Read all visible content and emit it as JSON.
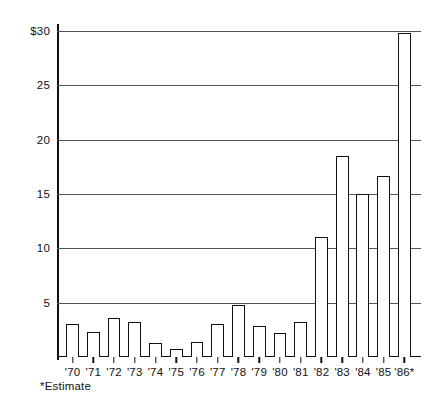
{
  "chart_data": {
    "type": "bar",
    "title": "",
    "subtitle": "",
    "xlabel": "",
    "ylabel": "",
    "categories": [
      "'70",
      "'71",
      "'72",
      "'73",
      "'74",
      "'75",
      "'76",
      "'77",
      "'78",
      "'79",
      "'80",
      "'81",
      "'82",
      "'83",
      "'84",
      "'85",
      "'86*"
    ],
    "values": [
      3.0,
      2.3,
      3.6,
      3.2,
      1.3,
      0.7,
      1.4,
      3.0,
      4.8,
      2.9,
      2.2,
      3.2,
      11.0,
      18.5,
      15.0,
      16.7,
      29.8
    ],
    "ylim": [
      0,
      30
    ],
    "y_ticks": [
      5,
      10,
      15,
      20,
      25,
      30
    ],
    "y_tick_labels": [
      "5",
      "10",
      "15",
      "20",
      "25",
      "$30"
    ],
    "grid": true,
    "legend": null,
    "annotations": [
      "*Estimate"
    ],
    "bar_fill": "#ffffff",
    "bar_stroke": "#111111",
    "grid_color": "#555555",
    "axis_color": "#111111"
  },
  "footnote": "*Estimate"
}
